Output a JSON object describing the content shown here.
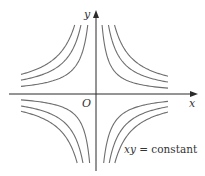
{
  "labels": {
    "x_axis": "x",
    "y_axis": "y",
    "origin": "O",
    "equation_vars": "xy",
    "equation_rest": " = constant"
  },
  "colors": {
    "axis": "#2b2b2b",
    "curve": "#6e6e6e",
    "background": "#ffffff"
  },
  "chart_data": {
    "type": "line",
    "title": "",
    "annotation": "xy = constant",
    "xlabel": "x",
    "ylabel": "y",
    "origin_label": "O",
    "grid": false,
    "origin_px": [
      96,
      94
    ],
    "xlim_px": [
      -75,
      72
    ],
    "ylim_px": [
      -69,
      69
    ],
    "quadrants": [
      {
        "name": "upper-right",
        "sign_x": 1,
        "sign_y": 1,
        "constants": [
          420,
          860,
          1280
        ]
      },
      {
        "name": "upper-left",
        "sign_x": -1,
        "sign_y": 1,
        "constants": [
          570,
          1040,
          1470
        ]
      },
      {
        "name": "lower-left",
        "sign_x": -1,
        "sign_y": -1,
        "constants": [
          440,
          900,
          1300
        ]
      },
      {
        "name": "lower-right",
        "sign_x": 1,
        "sign_y": -1,
        "constants": [
          530,
          915,
          1300
        ]
      }
    ]
  }
}
